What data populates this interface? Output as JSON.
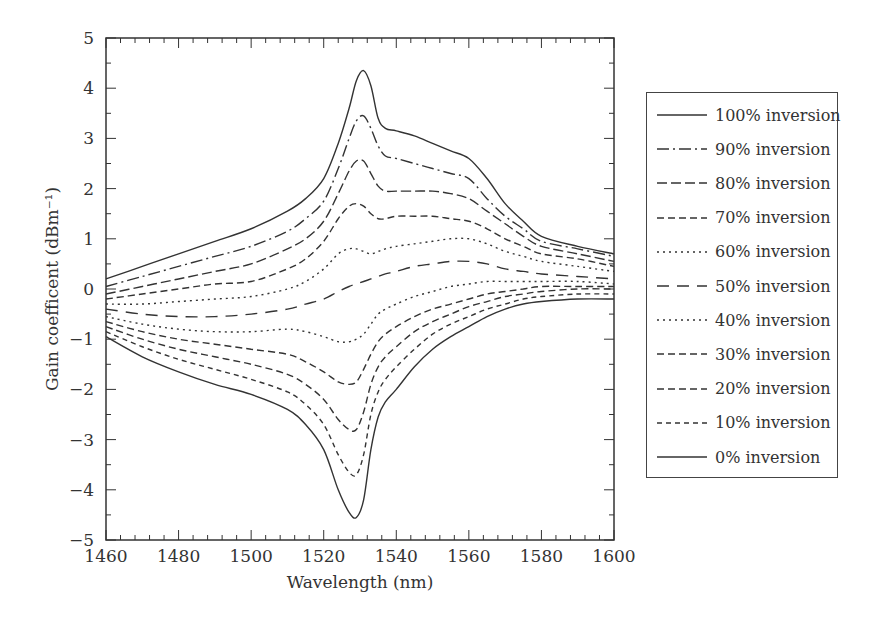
{
  "chart_data": {
    "type": "line",
    "title": "",
    "xlabel": "Wavelength (nm)",
    "ylabel": "Gain coefficent (dBm⁻¹)",
    "xlim": [
      1460,
      1600
    ],
    "ylim": [
      -5,
      5
    ],
    "xticks": [
      1460,
      1480,
      1500,
      1520,
      1540,
      1560,
      1580,
      1600
    ],
    "yticks": [
      5,
      4,
      3,
      2,
      1,
      0,
      -1,
      -2,
      -3,
      -4,
      -5
    ],
    "grid": false,
    "legend_position": "right-outside",
    "x": [
      1460,
      1470,
      1480,
      1490,
      1500,
      1510,
      1515,
      1520,
      1524,
      1527,
      1529,
      1531,
      1533,
      1535,
      1537,
      1540,
      1545,
      1550,
      1555,
      1560,
      1565,
      1570,
      1575,
      1580,
      1590,
      1600
    ],
    "series": [
      {
        "name": "100% inversion",
        "dash": "solid",
        "values": [
          0.2,
          0.45,
          0.7,
          0.95,
          1.2,
          1.55,
          1.8,
          2.2,
          2.9,
          3.6,
          4.15,
          4.35,
          4.05,
          3.4,
          3.2,
          3.15,
          3.05,
          2.9,
          2.75,
          2.6,
          2.2,
          1.7,
          1.35,
          1.05,
          0.85,
          0.7
        ]
      },
      {
        "name": "90% inversion",
        "dash": "dashdot",
        "values": [
          0.05,
          0.25,
          0.45,
          0.65,
          0.85,
          1.15,
          1.4,
          1.75,
          2.4,
          3.0,
          3.35,
          3.45,
          3.2,
          2.85,
          2.65,
          2.6,
          2.5,
          2.4,
          2.3,
          2.2,
          1.8,
          1.45,
          1.2,
          0.95,
          0.8,
          0.65
        ]
      },
      {
        "name": "80% inversion",
        "dash": "longdash",
        "values": [
          -0.1,
          0.05,
          0.2,
          0.35,
          0.5,
          0.8,
          1.0,
          1.35,
          1.9,
          2.35,
          2.55,
          2.55,
          2.3,
          2.05,
          1.95,
          1.95,
          1.95,
          1.95,
          1.9,
          1.8,
          1.55,
          1.3,
          1.05,
          0.85,
          0.7,
          0.55
        ]
      },
      {
        "name": "70% inversion",
        "dash": "medium",
        "values": [
          -0.2,
          -0.1,
          0.0,
          0.1,
          0.15,
          0.4,
          0.6,
          0.95,
          1.4,
          1.65,
          1.7,
          1.65,
          1.5,
          1.4,
          1.4,
          1.45,
          1.45,
          1.45,
          1.4,
          1.35,
          1.2,
          1.0,
          0.85,
          0.7,
          0.6,
          0.45
        ]
      },
      {
        "name": "60% inversion",
        "dash": "dotted",
        "values": [
          -0.3,
          -0.3,
          -0.25,
          -0.2,
          -0.15,
          0.0,
          0.15,
          0.4,
          0.7,
          0.8,
          0.8,
          0.75,
          0.7,
          0.75,
          0.8,
          0.85,
          0.9,
          0.95,
          1.0,
          1.0,
          0.9,
          0.75,
          0.65,
          0.55,
          0.45,
          0.35
        ]
      },
      {
        "name": "50% inversion",
        "dash": "longgap",
        "values": [
          -0.4,
          -0.5,
          -0.55,
          -0.55,
          -0.5,
          -0.4,
          -0.3,
          -0.2,
          -0.05,
          0.05,
          0.1,
          0.15,
          0.2,
          0.25,
          0.3,
          0.35,
          0.45,
          0.5,
          0.55,
          0.55,
          0.5,
          0.4,
          0.35,
          0.3,
          0.25,
          0.2
        ]
      },
      {
        "name": "40% inversion",
        "dash": "dotted",
        "values": [
          -0.55,
          -0.7,
          -0.8,
          -0.85,
          -0.85,
          -0.8,
          -0.85,
          -0.95,
          -1.05,
          -1.05,
          -1.0,
          -0.9,
          -0.7,
          -0.5,
          -0.4,
          -0.3,
          -0.15,
          -0.05,
          0.05,
          0.1,
          0.15,
          0.15,
          0.15,
          0.15,
          0.15,
          0.1
        ]
      },
      {
        "name": "30% inversion",
        "dash": "medium",
        "values": [
          -0.65,
          -0.85,
          -1.0,
          -1.1,
          -1.2,
          -1.3,
          -1.45,
          -1.65,
          -1.85,
          -1.9,
          -1.85,
          -1.6,
          -1.3,
          -1.05,
          -0.9,
          -0.75,
          -0.55,
          -0.4,
          -0.3,
          -0.2,
          -0.1,
          -0.05,
          0.0,
          0.05,
          0.05,
          0.05
        ]
      },
      {
        "name": "20% inversion",
        "dash": "medium",
        "values": [
          -0.75,
          -1.0,
          -1.2,
          -1.35,
          -1.5,
          -1.7,
          -1.9,
          -2.2,
          -2.6,
          -2.8,
          -2.8,
          -2.45,
          -1.9,
          -1.55,
          -1.35,
          -1.15,
          -0.85,
          -0.65,
          -0.5,
          -0.35,
          -0.25,
          -0.15,
          -0.1,
          -0.05,
          0.0,
          0.0
        ]
      },
      {
        "name": "10% inversion",
        "dash": "short",
        "values": [
          -0.85,
          -1.15,
          -1.4,
          -1.6,
          -1.8,
          -2.05,
          -2.3,
          -2.7,
          -3.3,
          -3.65,
          -3.7,
          -3.3,
          -2.5,
          -2.05,
          -1.8,
          -1.55,
          -1.2,
          -0.9,
          -0.7,
          -0.55,
          -0.4,
          -0.3,
          -0.2,
          -0.15,
          -0.1,
          -0.1
        ]
      },
      {
        "name": "0% inversion",
        "dash": "solid",
        "values": [
          -0.95,
          -1.35,
          -1.65,
          -1.9,
          -2.1,
          -2.4,
          -2.7,
          -3.2,
          -4.0,
          -4.45,
          -4.55,
          -4.2,
          -3.2,
          -2.55,
          -2.25,
          -2.0,
          -1.55,
          -1.2,
          -0.95,
          -0.75,
          -0.55,
          -0.4,
          -0.3,
          -0.25,
          -0.2,
          -0.2
        ]
      }
    ]
  }
}
